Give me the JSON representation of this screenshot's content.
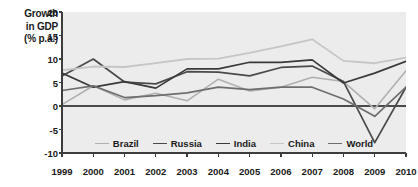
{
  "axis_title_lines": [
    "Growth",
    "in GDP",
    "(% p.a.)"
  ],
  "chart_data": {
    "type": "line",
    "title": "Growth in GDP (% p.a.)",
    "xlabel": "",
    "ylabel": "Growth in GDP (% p.a.)",
    "x": [
      1999,
      2000,
      2001,
      2002,
      2003,
      2004,
      2005,
      2006,
      2007,
      2008,
      2009,
      2010
    ],
    "categories": [
      "1999",
      "2000",
      "2001",
      "2002",
      "2003",
      "2004",
      "2005",
      "2006",
      "2007",
      "2008",
      "2009",
      "2010"
    ],
    "xlim": [
      1999,
      2010
    ],
    "ylim": [
      -10,
      20
    ],
    "yticks": [
      20,
      15,
      10,
      5,
      0,
      -5,
      -10
    ],
    "ytick_labels": [
      "20",
      "15",
      "10",
      "5",
      "0",
      "-5",
      "-10"
    ],
    "grid": false,
    "zero_line": true,
    "legend_position": "bottom",
    "series": [
      {
        "name": "Brazil",
        "color": "#b0b0b0",
        "width": 1.6,
        "values": [
          0.3,
          4.3,
          1.3,
          2.7,
          1.1,
          5.7,
          3.2,
          4.0,
          6.1,
          5.2,
          -0.6,
          7.5
        ]
      },
      {
        "name": "Russia",
        "color": "#4a4a4a",
        "width": 1.7,
        "values": [
          6.4,
          10.0,
          5.1,
          4.7,
          7.3,
          7.2,
          6.4,
          8.2,
          8.5,
          5.2,
          -7.8,
          4.0
        ]
      },
      {
        "name": "India",
        "color": "#3a3a3a",
        "width": 1.7,
        "values": [
          7.0,
          4.0,
          5.2,
          3.8,
          7.9,
          7.9,
          9.3,
          9.3,
          9.8,
          4.9,
          7.0,
          9.5
        ]
      },
      {
        "name": "China",
        "color": "#c6c6c6",
        "width": 1.8,
        "values": [
          7.6,
          8.4,
          8.3,
          9.1,
          10.0,
          10.1,
          11.3,
          12.7,
          14.2,
          9.6,
          9.1,
          10.3
        ]
      },
      {
        "name": "World",
        "color": "#6e6e6e",
        "width": 1.7,
        "values": [
          3.3,
          4.3,
          1.8,
          2.2,
          2.8,
          4.0,
          3.5,
          4.0,
          4.0,
          1.5,
          -2.2,
          4.0
        ]
      }
    ]
  },
  "legend": {
    "items": [
      {
        "label": "Brazil",
        "color": "#b0b0b0"
      },
      {
        "label": "Russia",
        "color": "#4a4a4a"
      },
      {
        "label": "India",
        "color": "#3a3a3a"
      },
      {
        "label": "China",
        "color": "#c6c6c6"
      },
      {
        "label": "World",
        "color": "#6e6e6e"
      }
    ]
  },
  "colors": {
    "plot_background": "#ececec",
    "axis": "#3d3d3d",
    "zero_line": "#4a4a4a",
    "text": "#1a1a1a"
  }
}
